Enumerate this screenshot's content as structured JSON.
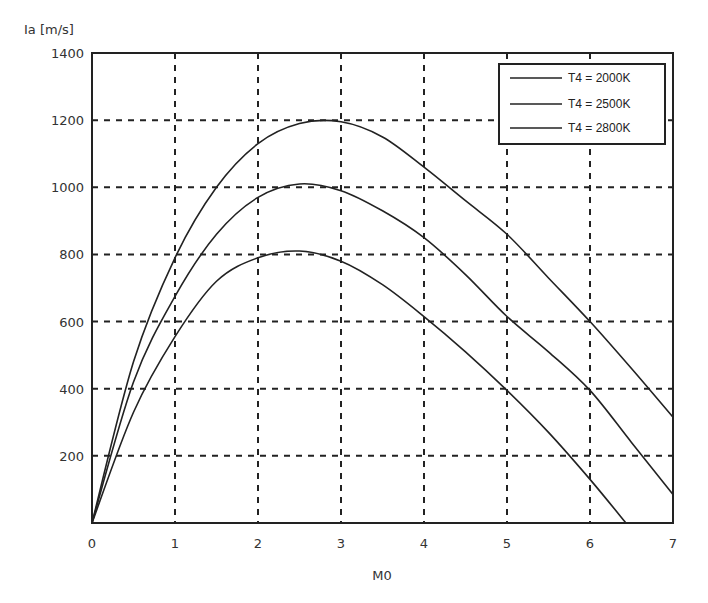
{
  "chart_data": {
    "type": "line",
    "title": "",
    "xlabel": "M0",
    "ylabel": "Ia [m/s]",
    "xlim": [
      0,
      7
    ],
    "ylim": [
      0,
      1400
    ],
    "xticks": [
      0,
      1,
      2,
      3,
      4,
      5,
      6,
      7
    ],
    "yticks": [
      200,
      400,
      600,
      800,
      1000,
      1200,
      1400
    ],
    "grid": true,
    "legend_position": "upper right",
    "x": [
      0,
      0.5,
      1,
      1.5,
      2,
      2.5,
      3,
      3.5,
      4,
      4.5,
      5,
      5.5,
      6,
      6.5,
      7
    ],
    "series": [
      {
        "name": "T4 = 2000K",
        "values": [
          0,
          330,
          555,
          720,
          790,
          810,
          780,
          710,
          615,
          510,
          395,
          270,
          130,
          -20,
          null
        ]
      },
      {
        "name": "T4 = 2500K",
        "values": [
          0,
          420,
          675,
          860,
          970,
          1010,
          990,
          930,
          850,
          740,
          615,
          510,
          395,
          240,
          85
        ]
      },
      {
        "name": "T4 = 2800K",
        "values": [
          0,
          480,
          790,
          1000,
          1130,
          1190,
          1195,
          1150,
          1060,
          960,
          860,
          730,
          600,
          460,
          315
        ]
      }
    ]
  },
  "ylabel_text": "Ia [m/s]",
  "xlabel_text": "M0",
  "legend": [
    "T4 = 2000K",
    "T4 = 2500K",
    "T4 = 2800K"
  ]
}
